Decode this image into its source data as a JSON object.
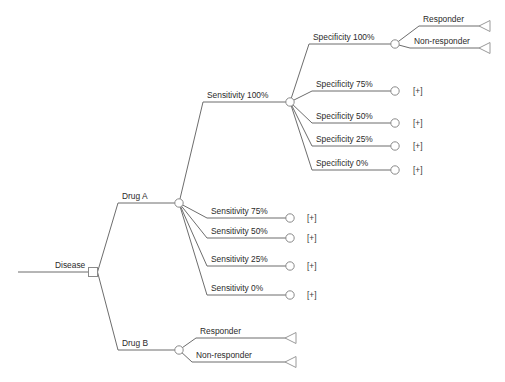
{
  "diagram": {
    "type": "decision-tree",
    "colors": {
      "background": "#ffffff",
      "edge": "#6d6d6d",
      "node_stroke": "#8a8a8a",
      "terminal_stroke": "#9a9a9a",
      "text": "#2b2b2b",
      "node_fill": "#ffffff"
    },
    "collapse_marker": "[+]",
    "root": {
      "label": "Disease",
      "node_type": "decision-square",
      "x": 93,
      "y": 272,
      "label_x": 55,
      "label_y": 268,
      "line_start_x": 18
    },
    "branches": [
      {
        "id": "drug-a",
        "label": "Drug A",
        "node_type": "chance-circle",
        "node_x": 179,
        "node_y": 203,
        "label_x": 122,
        "label_y": 199,
        "line_start_x": 118,
        "children": [
          {
            "id": "sensitivity-100",
            "label": "Sensitivity 100%",
            "node_type": "chance-circle",
            "node_x": 290,
            "node_y": 102,
            "label_x": 207,
            "label_y": 98,
            "line_start_x": 203,
            "collapsed": false,
            "children": [
              {
                "id": "specificity-100",
                "label": "Specificity 100%",
                "node_type": "chance-circle",
                "node_x": 395,
                "node_y": 44,
                "label_x": 313,
                "label_y": 40,
                "line_start_x": 309,
                "collapsed": false,
                "children": [
                  {
                    "id": "spec100-responder",
                    "label": "Responder",
                    "node_type": "terminal-triangle",
                    "node_x": 490,
                    "node_y": 26,
                    "label_x": 423,
                    "label_y": 22,
                    "line_start_x": 419
                  },
                  {
                    "id": "spec100-nonresponder",
                    "label": "Non-responder",
                    "node_type": "terminal-triangle",
                    "node_x": 490,
                    "node_y": 48,
                    "label_x": 414,
                    "label_y": 44,
                    "line_start_x": 410
                  }
                ]
              },
              {
                "id": "specificity-75",
                "label": "Specificity 75%",
                "node_type": "chance-circle",
                "node_x": 395,
                "node_y": 91,
                "label_x": 316,
                "label_y": 87,
                "line_start_x": 312,
                "collapsed": true,
                "marker_x": 413,
                "marker_y": 94
              },
              {
                "id": "specificity-50",
                "label": "Specificity 50%",
                "node_type": "chance-circle",
                "node_x": 395,
                "node_y": 123,
                "label_x": 316,
                "label_y": 119,
                "line_start_x": 312,
                "collapsed": true,
                "marker_x": 413,
                "marker_y": 126
              },
              {
                "id": "specificity-25",
                "label": "Specificity 25%",
                "node_type": "chance-circle",
                "node_x": 395,
                "node_y": 146,
                "label_x": 316,
                "label_y": 142,
                "line_start_x": 312,
                "collapsed": true,
                "marker_x": 413,
                "marker_y": 149
              },
              {
                "id": "specificity-0",
                "label": "Specificity 0%",
                "node_type": "chance-circle",
                "node_x": 395,
                "node_y": 170,
                "label_x": 316,
                "label_y": 166,
                "line_start_x": 312,
                "collapsed": true,
                "marker_x": 413,
                "marker_y": 173
              }
            ]
          },
          {
            "id": "sensitivity-75",
            "label": "Sensitivity 75%",
            "node_type": "chance-circle",
            "node_x": 290,
            "node_y": 218,
            "label_x": 211,
            "label_y": 214,
            "line_start_x": 207,
            "collapsed": true,
            "marker_x": 307,
            "marker_y": 221
          },
          {
            "id": "sensitivity-50",
            "label": "Sensitivity 50%",
            "node_type": "chance-circle",
            "node_x": 290,
            "node_y": 238,
            "label_x": 211,
            "label_y": 234,
            "line_start_x": 207,
            "collapsed": true,
            "marker_x": 307,
            "marker_y": 241
          },
          {
            "id": "sensitivity-25",
            "label": "Sensitivity 25%",
            "node_type": "chance-circle",
            "node_x": 290,
            "node_y": 266,
            "label_x": 211,
            "label_y": 262,
            "line_start_x": 207,
            "collapsed": true,
            "marker_x": 307,
            "marker_y": 269
          },
          {
            "id": "sensitivity-0",
            "label": "Sensitivity 0%",
            "node_type": "chance-circle",
            "node_x": 290,
            "node_y": 295,
            "label_x": 211,
            "label_y": 291,
            "line_start_x": 207,
            "collapsed": true,
            "marker_x": 307,
            "marker_y": 298
          }
        ]
      },
      {
        "id": "drug-b",
        "label": "Drug B",
        "node_type": "chance-circle",
        "node_x": 179,
        "node_y": 350,
        "label_x": 122,
        "label_y": 346,
        "line_start_x": 118,
        "children": [
          {
            "id": "drugb-responder",
            "label": "Responder",
            "node_type": "terminal-triangle",
            "node_x": 296,
            "node_y": 338,
            "label_x": 200,
            "label_y": 334,
            "line_start_x": 196
          },
          {
            "id": "drugb-nonresponder",
            "label": "Non-responder",
            "node_type": "terminal-triangle",
            "node_x": 296,
            "node_y": 362,
            "label_x": 196,
            "label_y": 358,
            "line_start_x": 192
          }
        ]
      }
    ]
  }
}
